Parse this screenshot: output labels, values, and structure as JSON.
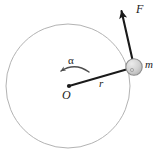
{
  "figure": {
    "kind": "physics-free-body-diagram",
    "background_color": "#ffffff",
    "labels": {
      "force": "F",
      "mass": "m",
      "radius": "r",
      "center": "O",
      "angular_acceleration": "α"
    },
    "colors": {
      "orbit_stroke": "#b3b3b3",
      "vector_stroke": "#1a1a1a",
      "arc_stroke": "#4d4d4d",
      "mass_fill": "#cfcfcf",
      "mass_stroke": "#8c8c8c",
      "text": "#1a1a1a"
    },
    "geometry": {
      "center": {
        "x": 68,
        "y": 86
      },
      "orbit_radius": 62,
      "mass": {
        "x": 134,
        "y": 67,
        "radius": 8
      },
      "radius_line": {
        "x1": 69,
        "y1": 86,
        "x2": 127,
        "y2": 69
      },
      "force_vector": {
        "x1": 132,
        "y1": 62,
        "x2": 121,
        "y2": 9
      },
      "arc_arrow": {
        "from_x": 88,
        "from_y": 71,
        "to_x": 60,
        "to_y": 72,
        "direction": "counterclockwise"
      }
    }
  }
}
